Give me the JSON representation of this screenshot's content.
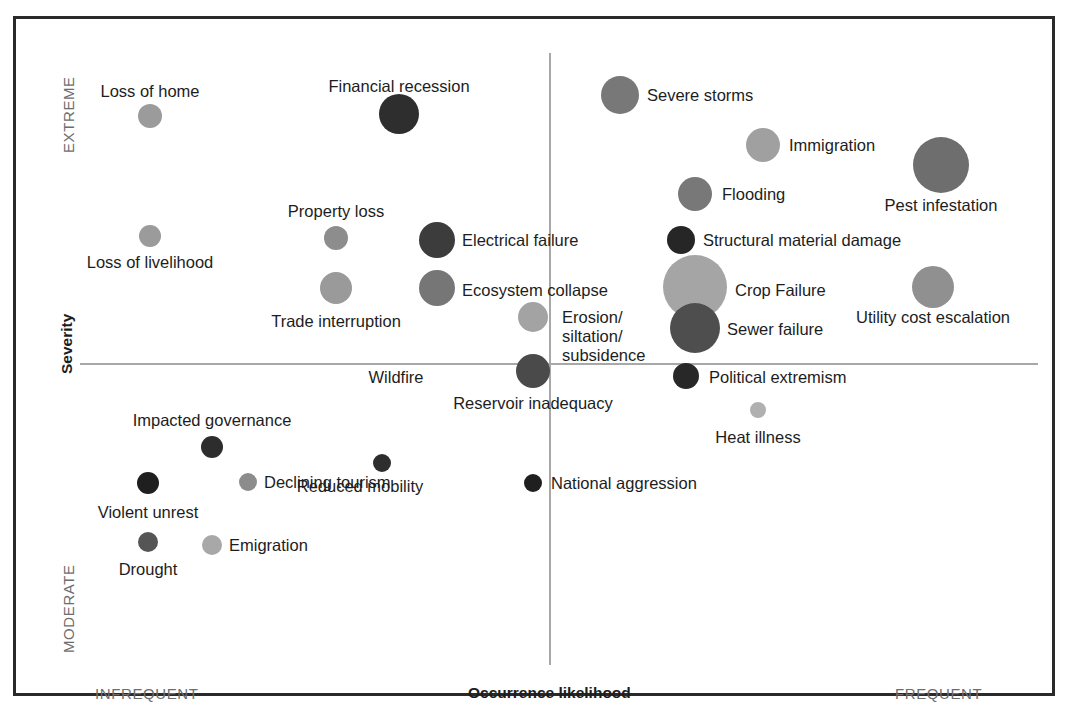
{
  "chart_data": {
    "type": "scatter",
    "title": "",
    "subtitle": "",
    "xlabel": "Occurrence likelihood",
    "ylabel": "Severity",
    "xlim": [
      0,
      100
    ],
    "ylim": [
      0,
      100
    ],
    "grid": false,
    "legend": "none",
    "axis_captions": {
      "x_low": "INFREQUENT",
      "x_high": "FREQUENT",
      "y_low": "MODERATE",
      "y_high": "EXTREME"
    },
    "quadrant_divider": {
      "x": 50,
      "y": 50
    },
    "points": [
      {
        "label": "Loss of home",
        "x": 15.0,
        "y": 86.1,
        "size": 13,
        "color": "#9b9b9b",
        "px": 150,
        "py": 116,
        "r": 12,
        "label_x": 150,
        "label_y": 82,
        "align": "center"
      },
      {
        "label": "Financial recession",
        "x": 43.0,
        "y": 86.6,
        "size": 20,
        "color": "#2e2e2e",
        "px": 399,
        "py": 114,
        "r": 20,
        "label_x": 399,
        "label_y": 77,
        "align": "center"
      },
      {
        "label": "Severe storms",
        "x": 65.0,
        "y": 89.4,
        "size": 19,
        "color": "#787878",
        "px": 620,
        "py": 95,
        "r": 19,
        "label_x": 647,
        "label_y": 86,
        "align": "left"
      },
      {
        "label": "Immigration",
        "x": 81.0,
        "y": 81.6,
        "size": 17,
        "color": "#a0a0a0",
        "px": 763,
        "py": 145,
        "r": 17,
        "label_x": 789,
        "label_y": 136,
        "align": "left"
      },
      {
        "label": "Pest infestation",
        "x": 100.0,
        "y": 78.5,
        "size": 28,
        "color": "#6e6e6e",
        "px": 941,
        "py": 165,
        "r": 28,
        "label_x": 941,
        "label_y": 196,
        "align": "center"
      },
      {
        "label": "Flooding",
        "x": 73.6,
        "y": 73.1,
        "size": 17,
        "color": "#787878",
        "px": 695,
        "py": 194,
        "r": 17,
        "label_x": 722,
        "label_y": 185,
        "align": "left"
      },
      {
        "label": "Property loss",
        "x": 36.5,
        "y": 66.0,
        "size": 12,
        "color": "#8d8d8d",
        "px": 336,
        "py": 238,
        "r": 12,
        "label_x": 336,
        "label_y": 202,
        "align": "center"
      },
      {
        "label": "Loss of livelihood",
        "x": 15.0,
        "y": 66.0,
        "size": 11,
        "color": "#9b9b9b",
        "px": 150,
        "py": 236,
        "r": 11,
        "label_x": 150,
        "label_y": 253,
        "align": "center"
      },
      {
        "label": "Electrical failure",
        "x": 47.5,
        "y": 65.7,
        "size": 18,
        "color": "#3c3c3c",
        "px": 437,
        "py": 240,
        "r": 18,
        "label_x": 462,
        "label_y": 231,
        "align": "left"
      },
      {
        "label": "Structural material damage",
        "x": 70.9,
        "y": 65.7,
        "size": 14,
        "color": "#262626",
        "px": 681,
        "py": 240,
        "r": 14,
        "label_x": 703,
        "label_y": 231,
        "align": "left"
      },
      {
        "label": "Ecosystem collapse",
        "x": 47.5,
        "y": 58.0,
        "size": 18,
        "color": "#767676",
        "px": 437,
        "py": 288,
        "r": 18,
        "label_x": 462,
        "label_y": 281,
        "align": "left"
      },
      {
        "label": "Crop Failure",
        "x": 74.0,
        "y": 58.2,
        "size": 32,
        "color": "#a5a5a5",
        "px": 695,
        "py": 287,
        "r": 32,
        "label_x": 735,
        "label_y": 281,
        "align": "left"
      },
      {
        "label": "Utility cost escalation",
        "x": 99.0,
        "y": 58.2,
        "size": 21,
        "color": "#909090",
        "px": 933,
        "py": 287,
        "r": 21,
        "label_x": 933,
        "label_y": 308,
        "align": "center"
      },
      {
        "label": "Trade interruption",
        "x": 36.5,
        "y": 58.0,
        "size": 16,
        "color": "#9a9a9a",
        "px": 336,
        "py": 288,
        "r": 16,
        "label_x": 336,
        "label_y": 312,
        "align": "center"
      },
      {
        "label": "Erosion/\nsiltation/\nsubsidence",
        "x": 50.0,
        "y": 53.4,
        "size": 15,
        "color": "#a3a3a3",
        "px": 533,
        "py": 317,
        "r": 15,
        "label_x": 562,
        "label_y": 308,
        "align": "left"
      },
      {
        "label": "Sewer failure",
        "x": 74.0,
        "y": 51.8,
        "size": 25,
        "color": "#4e4e4e",
        "px": 695,
        "py": 328,
        "r": 25,
        "label_x": 727,
        "label_y": 320,
        "align": "left"
      },
      {
        "label": "Reservoir inadequacy",
        "x": 50.0,
        "y": 45.5,
        "size": 17,
        "color": "#4a4a4a",
        "px": 533,
        "py": 371,
        "r": 17,
        "label_x": 533,
        "label_y": 394,
        "align": "center"
      },
      {
        "label": "Wildfire",
        "x": 41.0,
        "y": 44.0,
        "size": 0,
        "color": "#a3a3a3",
        "px": 396,
        "py": 376,
        "r": 0,
        "label_x": 396,
        "label_y": 368,
        "align": "center"
      },
      {
        "label": "Political extremism",
        "x": 71.5,
        "y": 45.7,
        "size": 13,
        "color": "#282828",
        "px": 686,
        "py": 376,
        "r": 13,
        "label_x": 709,
        "label_y": 368,
        "align": "left"
      },
      {
        "label": "Heat illness",
        "x": 79.0,
        "y": 40.0,
        "size": 8,
        "color": "#b0b0b0",
        "px": 758,
        "py": 410,
        "r": 8,
        "label_x": 758,
        "label_y": 428,
        "align": "center"
      },
      {
        "label": "Impacted governance",
        "x": 21.5,
        "y": 34.7,
        "size": 11,
        "color": "#2d2d2d",
        "px": 212,
        "py": 447,
        "r": 11,
        "label_x": 212,
        "label_y": 411,
        "align": "center"
      },
      {
        "label": "Violent unrest",
        "x": 14.7,
        "y": 29.3,
        "size": 11,
        "color": "#1f1f1f",
        "px": 148,
        "py": 483,
        "r": 11,
        "label_x": 148,
        "label_y": 503,
        "align": "center"
      },
      {
        "label": "Declining tourism",
        "x": 25.5,
        "y": 29.4,
        "size": 9,
        "color": "#8c8c8c",
        "px": 248,
        "py": 482,
        "r": 9,
        "label_x": 264,
        "label_y": 473,
        "align": "left"
      },
      {
        "label": "Reduced mobility",
        "x": 39.6,
        "y": 32.3,
        "size": 9,
        "color": "#2d2d2d",
        "px": 382,
        "py": 463,
        "r": 9,
        "label_x": 360,
        "label_y": 477,
        "align": "center"
      },
      {
        "label": "National aggression",
        "x": 50.0,
        "y": 29.3,
        "size": 9,
        "color": "#1f1f1f",
        "px": 533,
        "py": 483,
        "r": 9,
        "label_x": 551,
        "label_y": 474,
        "align": "left"
      },
      {
        "label": "Drought",
        "x": 14.7,
        "y": 20.5,
        "size": 10,
        "color": "#555555",
        "px": 148,
        "py": 542,
        "r": 10,
        "label_x": 148,
        "label_y": 560,
        "align": "center"
      },
      {
        "label": "Emigration",
        "x": 21.5,
        "y": 20.0,
        "size": 10,
        "color": "#a8a8a8",
        "px": 212,
        "py": 545,
        "r": 10,
        "label_x": 229,
        "label_y": 536,
        "align": "left"
      }
    ]
  },
  "axes": {
    "y_top_caption": "EXTREME",
    "y_bottom_caption": "MODERATE",
    "y_title": "Severity",
    "x_left_caption": "INFREQUENT",
    "x_right_caption": "FREQUENT",
    "x_title": "Occurrence likelihood"
  },
  "colors": {
    "frame": "#2a2a2a",
    "axis_line": "#a8a8a8",
    "caption_text": "#6d6d6d",
    "label_text": "#1d1d1d",
    "background": "#ffffff"
  }
}
